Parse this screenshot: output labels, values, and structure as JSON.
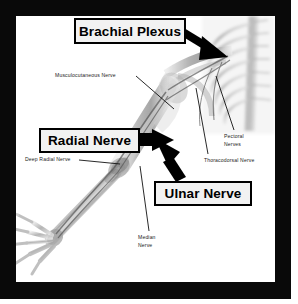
{
  "figure": {
    "frame_color": "#090909",
    "background_color": "#ffffff",
    "callouts": [
      {
        "id": "brachial-plexus",
        "label": "Brachial Plexus",
        "arrow_direction": "down-right",
        "points_to": "brachial plexus at shoulder / cervical spine"
      },
      {
        "id": "radial-nerve",
        "label": "Radial Nerve",
        "arrow_direction": "right",
        "points_to": "radial nerve at elbow"
      },
      {
        "id": "ulnar-nerve",
        "label": "Ulnar Nerve",
        "arrow_direction": "up-left",
        "points_to": "ulnar nerve along medial forearm"
      }
    ],
    "leader_labels": [
      {
        "id": "musculocutaneous-nerve",
        "label": "Musculocutaneous Nerve",
        "lines": [
          "Musculocutaneous Nerve"
        ]
      },
      {
        "id": "deep-radial-nerve",
        "label": "Deep Radial Nerve",
        "lines": [
          "Deep Radial Nerve"
        ]
      },
      {
        "id": "pectoral-nerves",
        "label": "Pectoral Nerves",
        "lines": [
          "Pectoral",
          "Nerves"
        ]
      },
      {
        "id": "thoracodorsal-nerve",
        "label": "Thoracodorsal Nerve",
        "lines": [
          "Thoracodorsal Nerve"
        ]
      },
      {
        "id": "median-nerve",
        "label": "Median Nerve",
        "lines": [
          "Median",
          "Nerve"
        ]
      }
    ]
  }
}
